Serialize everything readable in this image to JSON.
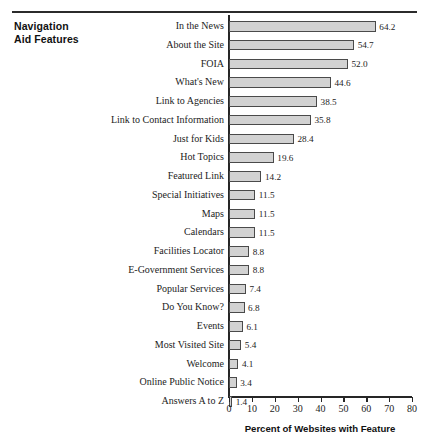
{
  "figure": {
    "block_title_line1": "Navigation",
    "block_title_line2": "Aid Features"
  },
  "chart_data": {
    "type": "bar",
    "orientation": "horizontal",
    "title": "Navigation Aid Features",
    "xlabel": "Percent of Websites with Feature",
    "ylabel": "",
    "xlim": [
      0,
      80
    ],
    "xticks": [
      0,
      10,
      20,
      30,
      40,
      50,
      60,
      70,
      80
    ],
    "grid": false,
    "legend": "none",
    "bar_color": "#d2d2d2",
    "bar_edge_color": "#4a4a4a",
    "axis_color": "#262626",
    "categories": [
      "In the News",
      "About the Site",
      "FOIA",
      "What's New",
      "Link to Agencies",
      "Link to Contact Information",
      "Just for Kids",
      "Hot Topics",
      "Featured Link",
      "Special Initiatives",
      "Maps",
      "Calendars",
      "Facilities Locator",
      "E-Government Services",
      "Popular Services",
      "Do You Know?",
      "Events",
      "Most Visited Site",
      "Welcome",
      "Online Public Notice",
      "Answers A to Z"
    ],
    "values": [
      64.2,
      54.7,
      52.0,
      44.6,
      38.5,
      35.8,
      28.4,
      19.6,
      14.2,
      11.5,
      11.5,
      11.5,
      8.8,
      8.8,
      7.4,
      6.8,
      6.1,
      5.4,
      4.1,
      3.4,
      1.4
    ],
    "value_labels": [
      "64.2",
      "54.7",
      "52.0",
      "44.6",
      "38.5",
      "35.8",
      "28.4",
      "19.6",
      "14.2",
      "11.5",
      "11.5",
      "11.5",
      "8.8",
      "8.8",
      "7.4",
      "6.8",
      "6.1",
      "5.4",
      "4.1",
      "3.4",
      "1.4"
    ],
    "xtick_labels": [
      "0",
      "10",
      "20",
      "30",
      "40",
      "50",
      "60",
      "70",
      "80"
    ]
  }
}
